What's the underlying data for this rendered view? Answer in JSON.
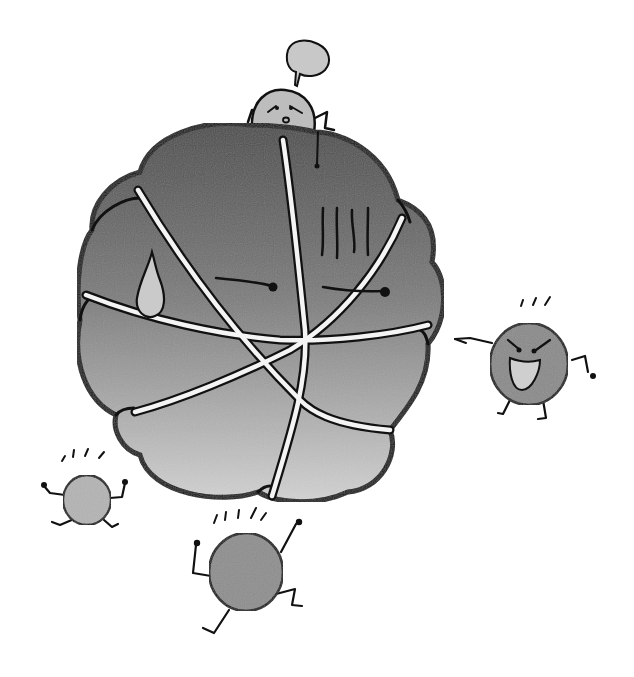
{
  "illustration": {
    "title": "Big ball surrounded by small characters",
    "description": "Hand-drawn grayscale cartoon: a large segmented ball with a worried face, a small character peeking over the top with an empty speech bubble, and three small round characters around it.",
    "colors": {
      "background": "#ffffff",
      "ink": "#111111",
      "ball_top": "#4a4a4a",
      "ball_bottom": "#d4d4d4",
      "character_fill": "#8a8a8a",
      "light_character_fill": "#b4b4b4",
      "speech_bubble": "#c8c8c8",
      "seam": "#f4f4f4"
    },
    "characters": [
      {
        "id": "big-ball",
        "expression": "worried / sweating",
        "features": [
          "sweat-drop",
          "gloom-lines",
          "half-closed-eyes"
        ]
      },
      {
        "id": "peeking-character",
        "expression": "worried",
        "features": [
          "speech-bubble"
        ]
      },
      {
        "id": "angry-character",
        "expression": "angry, pointing",
        "features": [
          "pointing-arm",
          "open-mouth"
        ]
      },
      {
        "id": "small-character-left",
        "expression": "excited"
      },
      {
        "id": "small-character-bottom",
        "expression": "running"
      }
    ],
    "speech_bubble_text": ""
  }
}
